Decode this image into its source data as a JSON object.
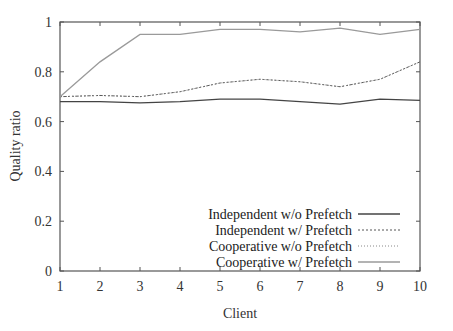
{
  "chart_data": {
    "type": "line",
    "title": "",
    "xlabel": "Client",
    "ylabel": "Quality ratio",
    "x": [
      1,
      2,
      3,
      4,
      5,
      6,
      7,
      8,
      9,
      10
    ],
    "xlim": [
      1,
      10
    ],
    "ylim": [
      0,
      1
    ],
    "xticks": [
      "1",
      "2",
      "3",
      "4",
      "5",
      "6",
      "7",
      "8",
      "9",
      "10"
    ],
    "yticks": [
      "0",
      "0.2",
      "0.4",
      "0.6",
      "0.8",
      "1"
    ],
    "grid": false,
    "legend_position": "lower right",
    "series": [
      {
        "name": "Independent w/o Prefetch",
        "style": "solid",
        "color": "#444444",
        "values": [
          0.68,
          0.68,
          0.675,
          0.68,
          0.69,
          0.69,
          0.68,
          0.67,
          0.69,
          0.685
        ]
      },
      {
        "name": "Independent w/ Prefetch",
        "style": "dashed",
        "color": "#666666",
        "values": [
          0.7,
          0.705,
          0.7,
          0.72,
          0.755,
          0.77,
          0.76,
          0.74,
          0.77,
          0.84
        ]
      },
      {
        "name": "Cooperative w/o Prefetch",
        "style": "dotted",
        "color": "#888888",
        "values": [
          0.7,
          0.705,
          0.7,
          0.72,
          0.755,
          0.77,
          0.76,
          0.74,
          0.77,
          0.84
        ]
      },
      {
        "name": "Cooperative w/ Prefetch",
        "style": "solid-light",
        "color": "#999999",
        "values": [
          0.7,
          0.84,
          0.95,
          0.95,
          0.97,
          0.97,
          0.96,
          0.975,
          0.95,
          0.97
        ]
      }
    ]
  }
}
